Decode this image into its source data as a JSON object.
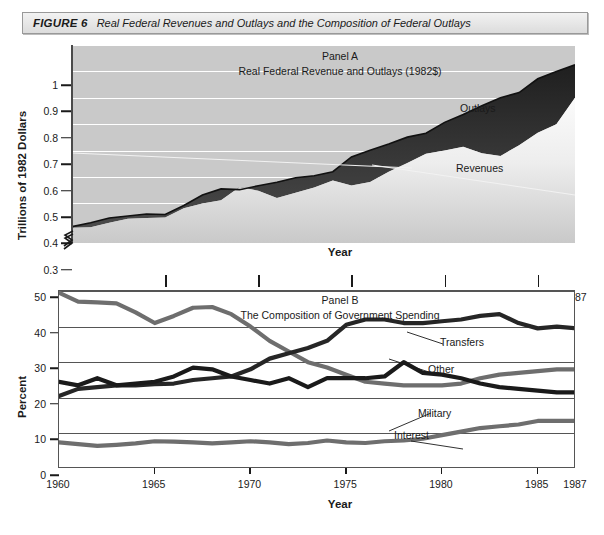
{
  "figure": {
    "label": "FIGURE 6",
    "title": "Real Federal Revenues and Outlays and the Composition of Federal Outlays"
  },
  "colors": {
    "panelA_background": "#c9c9c9",
    "panelA_gridline": "#ffffff",
    "outlays_band": "#2a2a2a",
    "revenues_band": "#f4f4f4",
    "panelB_background": "#ffffff",
    "panelB_gridline": "#555555",
    "transfers": "#262626",
    "other": "#1a1a1a",
    "military": "#6e6e6e",
    "interest": "#6e6e6e",
    "axis": "#1a1a1a"
  },
  "chart_data": [
    {
      "type": "area",
      "panel": "Panel A",
      "title": "Panel A",
      "subtitle": "Real Federal Revenue and Outlays (1982$)",
      "xlabel": "Year",
      "ylabel": "Trillions of 1982 Dollars",
      "xlim": [
        1960,
        1987
      ],
      "ylim": [
        0.25,
        1.0
      ],
      "yticks": [
        0.3,
        0.4,
        0.5,
        0.6,
        0.7,
        0.8,
        0.9,
        1
      ],
      "ytick_labels": [
        "0.3",
        "0.4",
        "0.5",
        "0.6",
        "0.7",
        "0.8",
        "0.9",
        "1"
      ],
      "xticks": [
        1960,
        1965,
        1970,
        1975,
        1980,
        1985,
        1987
      ],
      "xtick_labels": [
        "1960",
        "1965",
        "1970",
        "1975",
        "1980",
        "1985",
        "1987"
      ],
      "grid": true,
      "y_axis_break": true,
      "x": [
        1960,
        1961,
        1962,
        1963,
        1964,
        1965,
        1966,
        1967,
        1968,
        1969,
        1970,
        1971,
        1972,
        1973,
        1974,
        1975,
        1976,
        1977,
        1978,
        1979,
        1980,
        1981,
        1982,
        1983,
        1984,
        1985,
        1986,
        1987
      ],
      "series": [
        {
          "name": "Outlays",
          "values": [
            0.312,
            0.327,
            0.345,
            0.352,
            0.36,
            0.358,
            0.392,
            0.432,
            0.455,
            0.452,
            0.467,
            0.48,
            0.497,
            0.505,
            0.52,
            0.576,
            0.601,
            0.625,
            0.651,
            0.666,
            0.707,
            0.737,
            0.77,
            0.8,
            0.82,
            0.872,
            0.9,
            0.925
          ]
        },
        {
          "name": "Revenues",
          "values": [
            0.308,
            0.31,
            0.327,
            0.342,
            0.345,
            0.347,
            0.382,
            0.4,
            0.412,
            0.462,
            0.448,
            0.42,
            0.44,
            0.46,
            0.487,
            0.468,
            0.481,
            0.52,
            0.553,
            0.588,
            0.6,
            0.615,
            0.59,
            0.58,
            0.62,
            0.668,
            0.7,
            0.8
          ]
        }
      ],
      "annotations": [
        {
          "text": "Outlays",
          "x": 1981,
          "y": 0.9
        },
        {
          "text": "Revenues",
          "x": 1980,
          "y": 0.63
        }
      ]
    },
    {
      "type": "line",
      "panel": "Panel B",
      "title": "Panel B",
      "subtitle": "The Composition of Government Spending",
      "xlabel": "Year",
      "ylabel": "Percent",
      "xlim": [
        1960,
        1987
      ],
      "ylim": [
        0,
        50
      ],
      "yticks": [
        0,
        10,
        20,
        30,
        40,
        50
      ],
      "ytick_labels": [
        "0",
        "10",
        "20",
        "30",
        "40",
        "50"
      ],
      "xticks": [
        1960,
        1965,
        1970,
        1975,
        1980,
        1985,
        1987
      ],
      "xtick_labels": [
        "1960",
        "1965",
        "1970",
        "1975",
        "1980",
        "1985",
        "1987"
      ],
      "grid": true,
      "x": [
        1960,
        1961,
        1962,
        1963,
        1964,
        1965,
        1966,
        1967,
        1968,
        1969,
        1970,
        1971,
        1972,
        1973,
        1974,
        1975,
        1976,
        1977,
        1978,
        1979,
        1980,
        1981,
        1982,
        1983,
        1984,
        1985,
        1986,
        1987
      ],
      "series": [
        {
          "name": "Military",
          "values": [
            49.5,
            47.0,
            46.8,
            46.5,
            44.0,
            41.0,
            43.0,
            45.3,
            45.5,
            43.5,
            40.0,
            36.0,
            33.0,
            30.0,
            28.5,
            26.5,
            24.5,
            24.0,
            23.5,
            23.5,
            23.5,
            24.0,
            25.5,
            26.5,
            27.0,
            27.5,
            28.0,
            28.0
          ]
        },
        {
          "name": "Transfers",
          "values": [
            20.5,
            22.5,
            23.0,
            23.5,
            23.5,
            23.8,
            24.0,
            25.0,
            25.5,
            26.0,
            28.0,
            31.0,
            32.5,
            34.0,
            36.0,
            40.5,
            42.0,
            42.0,
            41.0,
            41.0,
            41.5,
            42.0,
            43.0,
            43.5,
            41.0,
            39.5,
            40.0,
            39.5
          ]
        },
        {
          "name": "Other",
          "values": [
            24.5,
            23.5,
            25.5,
            23.5,
            24.0,
            24.5,
            26.0,
            28.5,
            28.0,
            26.0,
            25.0,
            24.0,
            25.5,
            23.0,
            25.5,
            25.5,
            25.5,
            26.0,
            30.0,
            27.0,
            26.5,
            25.5,
            24.0,
            23.0,
            22.5,
            22.0,
            21.5,
            21.5
          ]
        },
        {
          "name": "Interest",
          "values": [
            7.5,
            7.0,
            6.5,
            6.8,
            7.2,
            7.8,
            7.7,
            7.5,
            7.2,
            7.5,
            7.8,
            7.5,
            7.0,
            7.3,
            8.0,
            7.5,
            7.3,
            7.8,
            8.0,
            8.5,
            9.5,
            10.5,
            11.5,
            12.0,
            12.5,
            13.5,
            13.5,
            13.5
          ]
        }
      ],
      "annotations": [
        {
          "text": "Transfers",
          "x": 1978,
          "y": 38.5
        },
        {
          "text": "Other",
          "x": 1976,
          "y": 31.0
        },
        {
          "text": "Military",
          "x": 1976,
          "y": 19.5
        },
        {
          "text": "Interest",
          "x": 1974,
          "y": 13.5
        }
      ]
    }
  ]
}
